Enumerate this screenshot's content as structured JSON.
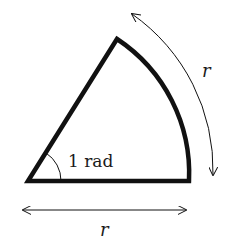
{
  "diagram": {
    "angle_label": "1 rad",
    "radius_label_bottom": "r",
    "arc_label": "r",
    "colors": {
      "stroke": "#111111",
      "text": "#1a1a1a",
      "background": "#ffffff"
    }
  }
}
